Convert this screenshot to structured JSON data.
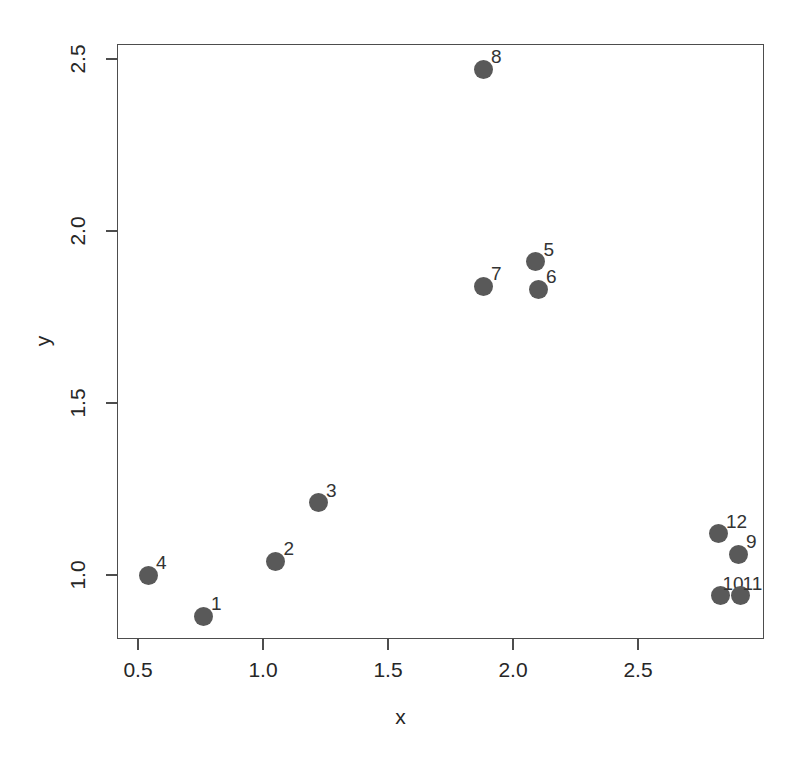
{
  "chart_data": {
    "type": "scatter",
    "title": "",
    "xlabel": "x",
    "ylabel": "y",
    "xlim": [
      0.41,
      3.0
    ],
    "ylim": [
      0.83,
      2.56
    ],
    "grid": false,
    "legend": null,
    "point_color": "#595959",
    "frame_color": "#4d4d4d",
    "background": "#ffffff",
    "x_ticks": [
      {
        "value": 0.5,
        "label": "0.5"
      },
      {
        "value": 1.0,
        "label": "1.0"
      },
      {
        "value": 1.5,
        "label": "1.5"
      },
      {
        "value": 2.0,
        "label": "2.0"
      },
      {
        "value": 2.5,
        "label": "2.5"
      }
    ],
    "y_ticks": [
      {
        "value": 1.0,
        "label": "1.0"
      },
      {
        "value": 1.5,
        "label": "1.5"
      },
      {
        "value": 2.0,
        "label": "2.0"
      },
      {
        "value": 2.5,
        "label": "2.5"
      }
    ],
    "points": [
      {
        "label": "1",
        "x": 0.76,
        "y": 0.88,
        "label_dx": 8,
        "label_dy": -22
      },
      {
        "label": "2",
        "x": 1.05,
        "y": 1.04,
        "label_dx": 8,
        "label_dy": -22
      },
      {
        "label": "3",
        "x": 1.22,
        "y": 1.21,
        "label_dx": 8,
        "label_dy": -22
      },
      {
        "label": "4",
        "x": 0.54,
        "y": 1.0,
        "label_dx": 8,
        "label_dy": -22
      },
      {
        "label": "5",
        "x": 2.09,
        "y": 1.91,
        "label_dx": 8,
        "label_dy": -22
      },
      {
        "label": "6",
        "x": 2.1,
        "y": 1.83,
        "label_dx": 8,
        "label_dy": -22
      },
      {
        "label": "7",
        "x": 1.88,
        "y": 1.84,
        "label_dx": 8,
        "label_dy": -22
      },
      {
        "label": "8",
        "x": 1.88,
        "y": 2.47,
        "label_dx": 8,
        "label_dy": -22
      },
      {
        "label": "9",
        "x": 2.9,
        "y": 1.06,
        "label_dx": 8,
        "label_dy": -22
      },
      {
        "label": "10",
        "x": 2.83,
        "y": 0.94,
        "label_dx": 2,
        "label_dy": -22
      },
      {
        "label": "11",
        "x": 2.91,
        "y": 0.94,
        "label_dx": 2,
        "label_dy": -22
      },
      {
        "label": "12",
        "x": 2.82,
        "y": 1.12,
        "label_dx": 8,
        "label_dy": -22
      }
    ]
  },
  "axes": {
    "x_title": "x",
    "y_title": "y"
  }
}
